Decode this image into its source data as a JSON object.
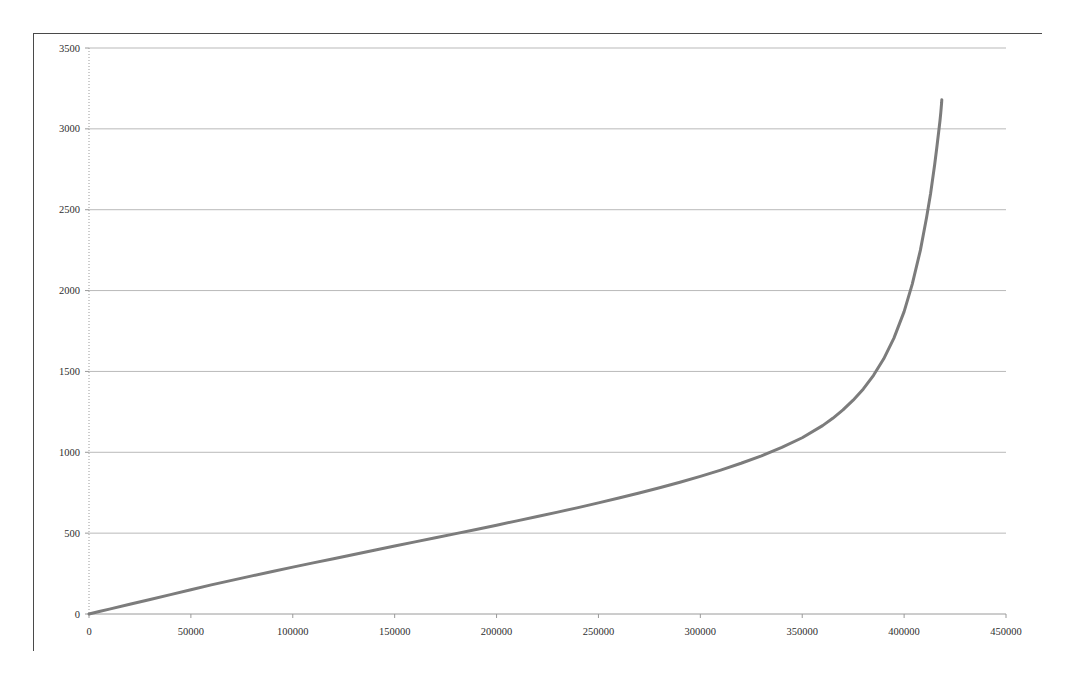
{
  "page": {
    "top_cut_text": "",
    "background_color": "#ffffff",
    "frame_border_color": "#4a4a4a"
  },
  "chart_data": {
    "type": "line",
    "title": "",
    "subtitle": "",
    "xlabel": "",
    "ylabel": "",
    "grid": true,
    "grid_axis": "y",
    "legend": false,
    "legend_position": "none",
    "xlim": [
      0,
      450000
    ],
    "ylim": [
      0,
      3500
    ],
    "xticks": [
      0,
      50000,
      100000,
      150000,
      200000,
      250000,
      300000,
      350000,
      400000,
      450000
    ],
    "xtick_labels": [
      "0",
      "50000",
      "100000",
      "150000",
      "200000",
      "250000",
      "300000",
      "350000",
      "400000",
      "450000"
    ],
    "yticks": [
      0,
      500,
      1000,
      1500,
      2000,
      2500,
      3000,
      3500
    ],
    "ytick_labels": [
      "0",
      "500",
      "1000",
      "1500",
      "2000",
      "2500",
      "3000",
      "3500"
    ],
    "series": [
      {
        "name": "curve",
        "color": "#7c7c7c",
        "line_width": 3.0,
        "x": [
          0,
          5000,
          10000,
          20000,
          30000,
          40000,
          50000,
          60000,
          70000,
          80000,
          90000,
          100000,
          110000,
          120000,
          130000,
          140000,
          150000,
          160000,
          170000,
          180000,
          190000,
          200000,
          210000,
          220000,
          230000,
          240000,
          250000,
          260000,
          270000,
          280000,
          290000,
          300000,
          310000,
          320000,
          330000,
          340000,
          350000,
          360000,
          365000,
          370000,
          375000,
          380000,
          385000,
          390000,
          395000,
          400000,
          404000,
          408000,
          411000,
          413000,
          415000,
          416000,
          417000,
          417600,
          418000,
          418200,
          418400,
          418500
        ],
        "y": [
          0,
          15,
          30,
          60,
          90,
          120,
          150,
          180,
          208,
          236,
          263,
          290,
          316,
          342,
          368,
          394,
          420,
          446,
          471,
          497,
          523,
          549,
          576,
          603,
          630,
          658,
          687,
          717,
          748,
          781,
          815,
          851,
          890,
          932,
          978,
          1030,
          1090,
          1165,
          1210,
          1262,
          1322,
          1392,
          1476,
          1578,
          1706,
          1870,
          2040,
          2250,
          2450,
          2600,
          2780,
          2880,
          2985,
          3050,
          3100,
          3130,
          3160,
          3180
        ],
        "asymptote_x": 418500,
        "max_y": 3180
      }
    ]
  },
  "axes": {
    "axis_line_color": "#9a9a9a",
    "gridline_color": "#b9b9b9",
    "tick_color": "#9a9a9a",
    "tick_label_color": "#2e2e2e"
  }
}
